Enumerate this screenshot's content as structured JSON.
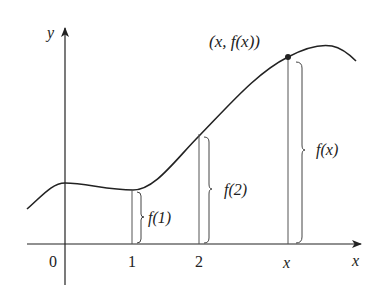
{
  "diagram": {
    "type": "function-graph",
    "colors": {
      "line": "#222222",
      "guide": "#555555",
      "background": "#ffffff"
    },
    "axes": {
      "x_label": "x",
      "y_label": "y",
      "ticks": [
        {
          "label": "0",
          "pos": "origin"
        },
        {
          "label": "1",
          "pos": 1
        },
        {
          "label": "2",
          "pos": 2
        },
        {
          "label": "x",
          "pos": "x"
        }
      ]
    },
    "point_label": "(x, f(x))",
    "heights": [
      {
        "label": "f(1)",
        "at": "1"
      },
      {
        "label": "f(2)",
        "at": "2"
      },
      {
        "label": "f(x)",
        "at": "x"
      }
    ]
  }
}
